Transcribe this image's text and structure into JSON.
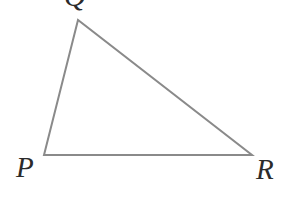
{
  "figure": {
    "kind": "geometry-diagram",
    "shape": "triangle",
    "name": "Triangle PQR",
    "canvas": {
      "width": 290,
      "height": 197
    },
    "background_color": "#ffffff",
    "stroke_color": "#8a8a8a",
    "stroke_width": 2,
    "label_color": "#2b2b2b"
  },
  "vertices": [
    {
      "id": "P",
      "label": "P",
      "x": 44,
      "y": 155,
      "label_x": 16,
      "label_y": 153,
      "position": "bottom-left"
    },
    {
      "id": "Q",
      "label": "Q",
      "x": 78,
      "y": 20,
      "label_x": 64,
      "label_y": -19,
      "position": "top",
      "clipped": "top"
    },
    {
      "id": "R",
      "label": "R",
      "x": 252,
      "y": 155,
      "label_x": 256,
      "label_y": 155,
      "position": "bottom-right"
    }
  ],
  "sides": [
    {
      "id": "PQ",
      "from": "P",
      "to": "Q"
    },
    {
      "id": "QR",
      "from": "Q",
      "to": "R"
    },
    {
      "id": "RP",
      "from": "R",
      "to": "P"
    }
  ],
  "polygon_points": "44,155 78,20 252,155"
}
